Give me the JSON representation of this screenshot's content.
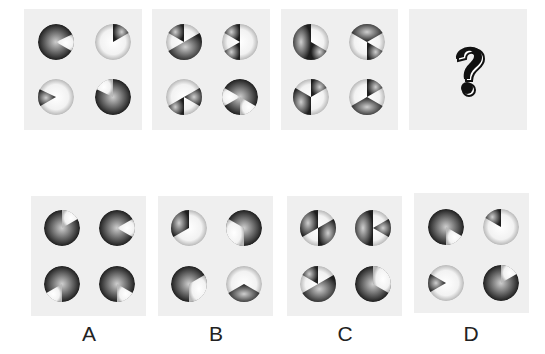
{
  "question": {
    "panels": [
      {
        "id": "q1",
        "x": 24,
        "y": 9,
        "w": 118,
        "h": 121,
        "discs": [
          {
            "cx": 56,
            "cy": 42,
            "base": "dark",
            "wedges": [
              {
                "from": 65,
                "to": 120,
                "tone": "light"
              }
            ]
          },
          {
            "cx": 113,
            "cy": 42,
            "base": "light",
            "wedges": [
              {
                "from": 0,
                "to": 60,
                "tone": "dark"
              }
            ]
          },
          {
            "cx": 56,
            "cy": 97,
            "base": "light",
            "wedges": [
              {
                "from": 240,
                "to": 295,
                "tone": "dark"
              }
            ]
          },
          {
            "cx": 113,
            "cy": 97,
            "base": "dark",
            "wedges": [
              {
                "from": 295,
                "to": 360,
                "tone": "light"
              }
            ]
          }
        ]
      },
      {
        "id": "q2",
        "x": 152,
        "y": 9,
        "w": 118,
        "h": 121,
        "discs": [
          {
            "cx": 184,
            "cy": 42,
            "base": "light",
            "wedges": [
              {
                "from": 300,
                "to": 360,
                "tone": "dark"
              },
              {
                "from": 60,
                "to": 240,
                "tone": "dark"
              }
            ]
          },
          {
            "cx": 240,
            "cy": 42,
            "base": "light",
            "wedges": [
              {
                "from": 300,
                "to": 360,
                "tone": "dark"
              },
              {
                "from": 180,
                "to": 240,
                "tone": "dark"
              }
            ]
          },
          {
            "cx": 184,
            "cy": 97,
            "base": "light",
            "wedges": [
              {
                "from": 60,
                "to": 120,
                "tone": "dark"
              },
              {
                "from": 180,
                "to": 240,
                "tone": "dark"
              }
            ]
          },
          {
            "cx": 240,
            "cy": 97,
            "base": "dark",
            "wedges": [
              {
                "from": 240,
                "to": 300,
                "tone": "light"
              },
              {
                "from": 120,
                "to": 180,
                "tone": "light"
              }
            ]
          }
        ]
      },
      {
        "id": "q3",
        "x": 281,
        "y": 9,
        "w": 117,
        "h": 121,
        "discs": [
          {
            "cx": 311,
            "cy": 42,
            "base": "light",
            "wedges": [
              {
                "from": 180,
                "to": 360,
                "tone": "dark"
              },
              {
                "from": 120,
                "to": 180,
                "tone": "dark"
              }
            ]
          },
          {
            "cx": 367,
            "cy": 42,
            "base": "light",
            "wedges": [
              {
                "from": 300,
                "to": 60,
                "tone": "dark"
              },
              {
                "from": 120,
                "to": 180,
                "tone": "dark"
              }
            ]
          },
          {
            "cx": 311,
            "cy": 97,
            "base": "light",
            "wedges": [
              {
                "from": 0,
                "to": 60,
                "tone": "dark"
              },
              {
                "from": 180,
                "to": 300,
                "tone": "dark"
              }
            ]
          },
          {
            "cx": 367,
            "cy": 97,
            "base": "light",
            "wedges": [
              {
                "from": 0,
                "to": 60,
                "tone": "dark"
              },
              {
                "from": 120,
                "to": 240,
                "tone": "dark"
              }
            ]
          }
        ]
      },
      {
        "id": "q4",
        "x": 409,
        "y": 9,
        "w": 118,
        "h": 121,
        "question_mark": "?"
      }
    ]
  },
  "options": [
    {
      "label": "A",
      "x": 31,
      "y": 196,
      "w": 115,
      "h": 120,
      "label_x": 69,
      "label_y": 322,
      "discs": [
        {
          "cx": 62,
          "cy": 228,
          "base": "dark",
          "wedges": [
            {
              "from": 0,
              "to": 60,
              "tone": "light"
            }
          ]
        },
        {
          "cx": 117,
          "cy": 228,
          "base": "dark",
          "wedges": [
            {
              "from": 60,
              "to": 120,
              "tone": "light"
            }
          ]
        },
        {
          "cx": 62,
          "cy": 284,
          "base": "dark",
          "wedges": [
            {
              "from": 180,
              "to": 240,
              "tone": "light"
            }
          ]
        },
        {
          "cx": 117,
          "cy": 284,
          "base": "dark",
          "wedges": [
            {
              "from": 120,
              "to": 180,
              "tone": "light"
            }
          ]
        }
      ]
    },
    {
      "label": "B",
      "x": 158,
      "y": 196,
      "w": 115,
      "h": 120,
      "label_x": 196,
      "label_y": 322,
      "discs": [
        {
          "cx": 189,
          "cy": 228,
          "base": "light",
          "wedges": [
            {
              "from": 240,
              "to": 360,
              "tone": "dark"
            }
          ]
        },
        {
          "cx": 244,
          "cy": 228,
          "base": "dark",
          "wedges": [
            {
              "from": 180,
              "to": 300,
              "tone": "light"
            }
          ]
        },
        {
          "cx": 189,
          "cy": 284,
          "base": "dark",
          "wedges": [
            {
              "from": 60,
              "to": 180,
              "tone": "light"
            }
          ]
        },
        {
          "cx": 244,
          "cy": 284,
          "base": "light",
          "wedges": [
            {
              "from": 120,
              "to": 240,
              "tone": "dark"
            }
          ]
        }
      ]
    },
    {
      "label": "C",
      "x": 287,
      "y": 196,
      "w": 115,
      "h": 120,
      "label_x": 325,
      "label_y": 322,
      "discs": [
        {
          "cx": 318,
          "cy": 228,
          "base": "light",
          "wedges": [
            {
              "from": 240,
              "to": 360,
              "tone": "dark"
            },
            {
              "from": 60,
              "to": 180,
              "tone": "dark"
            }
          ]
        },
        {
          "cx": 373,
          "cy": 228,
          "base": "light",
          "wedges": [
            {
              "from": 180,
              "to": 360,
              "tone": "dark"
            },
            {
              "from": 60,
              "to": 120,
              "tone": "dark"
            }
          ]
        },
        {
          "cx": 318,
          "cy": 284,
          "base": "light",
          "wedges": [
            {
              "from": 300,
              "to": 360,
              "tone": "dark"
            },
            {
              "from": 60,
              "to": 240,
              "tone": "dark"
            }
          ]
        },
        {
          "cx": 373,
          "cy": 284,
          "base": "dark",
          "wedges": [
            {
              "from": 0,
              "to": 120,
              "tone": "light"
            }
          ]
        }
      ]
    },
    {
      "label": "D",
      "x": 414,
      "y": 193,
      "w": 115,
      "h": 120,
      "label_x": 451,
      "label_y": 322,
      "discs": [
        {
          "cx": 446,
          "cy": 227,
          "base": "dark",
          "wedges": [
            {
              "from": 120,
              "to": 180,
              "tone": "light"
            }
          ]
        },
        {
          "cx": 501,
          "cy": 227,
          "base": "light",
          "wedges": [
            {
              "from": 300,
              "to": 360,
              "tone": "dark"
            }
          ]
        },
        {
          "cx": 446,
          "cy": 283,
          "base": "light",
          "wedges": [
            {
              "from": 240,
              "to": 300,
              "tone": "dark"
            }
          ]
        },
        {
          "cx": 501,
          "cy": 283,
          "base": "dark",
          "wedges": [
            {
              "from": 0,
              "to": 60,
              "tone": "light"
            }
          ]
        }
      ]
    }
  ],
  "colors": {
    "panel_bg": "#efefef",
    "dark_center": "#cfcfcf",
    "dark_edge": "#1e1e1e",
    "light_center": "#ffffff",
    "light_edge": "#b8b8b8"
  }
}
